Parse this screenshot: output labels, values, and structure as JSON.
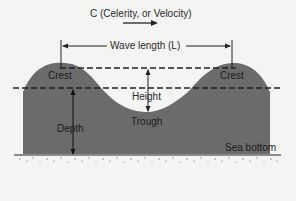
{
  "diagram": {
    "title": "C (Celerity, or Velocity)",
    "labels": {
      "wavelength": "Wave length (L)",
      "crest_left": "Crest",
      "crest_right": "Crest",
      "height": "Height",
      "trough": "Trough",
      "depth": "Depth",
      "sea_bottom": "Sea bottom"
    },
    "colors": {
      "water": "#6b6b6b",
      "background": "#f4f4f2",
      "lines": "#222222"
    }
  }
}
